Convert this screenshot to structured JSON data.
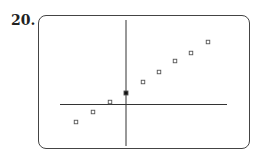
{
  "problem_number": "20.",
  "chart_data": {
    "type": "scatter",
    "title": "",
    "xlabel": "",
    "ylabel": "",
    "grid": false,
    "axes": {
      "x_axis_pixel_y": 104.5,
      "y_axis_pixel_x": 126
    },
    "points": [
      {
        "x": -3,
        "y": -1.8,
        "marker": "open-square"
      },
      {
        "x": -2,
        "y": -0.8,
        "marker": "open-square"
      },
      {
        "x": -1,
        "y": 0.2,
        "marker": "open-square"
      },
      {
        "x": 0,
        "y": 1.1,
        "marker": "filled-square"
      },
      {
        "x": 1,
        "y": 2.2,
        "marker": "open-square"
      },
      {
        "x": 2,
        "y": 3.2,
        "marker": "open-square"
      },
      {
        "x": 3,
        "y": 4.3,
        "marker": "open-square"
      },
      {
        "x": 4,
        "y": 5.1,
        "marker": "open-square"
      },
      {
        "x": 5,
        "y": 6.2,
        "marker": "open-square"
      }
    ],
    "pixel_points": [
      [
        76,
        122
      ],
      [
        93,
        112
      ],
      [
        110,
        102
      ],
      [
        126,
        93
      ],
      [
        143,
        82
      ],
      [
        159,
        72
      ],
      [
        175,
        61
      ],
      [
        191,
        53
      ],
      [
        208,
        42
      ]
    ],
    "filled_index": 3
  }
}
